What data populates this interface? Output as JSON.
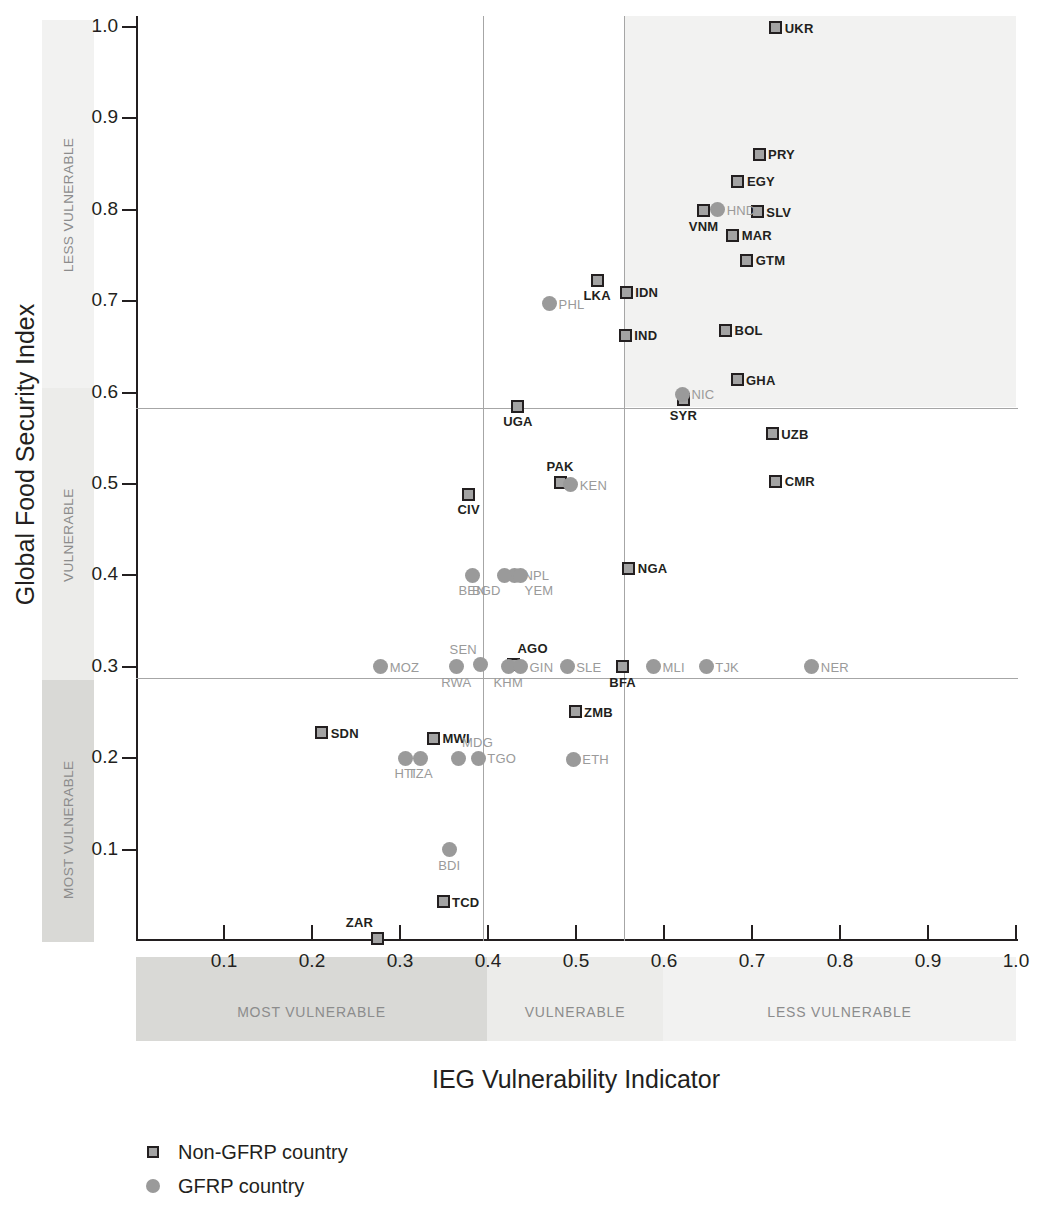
{
  "chart_data": {
    "type": "scatter",
    "title": "",
    "xlabel": "IEG Vulnerability Indicator",
    "ylabel": "Global Food Security Index",
    "xlim": [
      0,
      1.0
    ],
    "ylim": [
      0,
      1.0
    ],
    "grid": false,
    "x_ticks": [
      "0.1",
      "0.2",
      "0.3",
      "0.4",
      "0.5",
      "0.6",
      "0.7",
      "0.8",
      "0.9",
      "1.0"
    ],
    "x_tick_values": [
      0.1,
      0.2,
      0.3,
      0.4,
      0.5,
      0.6,
      0.7,
      0.8,
      0.9,
      1.0
    ],
    "y_ticks": [
      "0.1",
      "0.2",
      "0.3",
      "0.4",
      "0.5",
      "0.6",
      "0.7",
      "0.8",
      "0.9",
      "1.0"
    ],
    "y_tick_values": [
      0.1,
      0.2,
      0.3,
      0.4,
      0.5,
      0.6,
      0.7,
      0.8,
      0.9,
      1.0
    ],
    "x_band_labels": [
      "MOST VULNERABLE",
      "VULNERABLE",
      "LESS VULNERABLE"
    ],
    "y_band_labels": [
      "LESS VULNERABLE",
      "VULNERABLE",
      "MOST VULNERABLE"
    ],
    "x_dividers": [
      0.394,
      0.555
    ],
    "y_dividers": [
      0.583,
      0.288
    ],
    "legend_position": "bottom-left",
    "legend": [
      {
        "label": "Non-GFRP country",
        "marker": "square",
        "color": "#a3a3a3",
        "edge": "#231f20"
      },
      {
        "label": "GFRP country",
        "marker": "circle",
        "color": "#9a9a9a"
      }
    ],
    "series": [
      {
        "name": "Non-GFRP country",
        "marker": "square",
        "points": [
          {
            "label": "UKR",
            "x": 0.727,
            "y": 0.999,
            "lp": "lp-r"
          },
          {
            "label": "PRY",
            "x": 0.708,
            "y": 0.861,
            "lp": "lp-r"
          },
          {
            "label": "EGY",
            "x": 0.684,
            "y": 0.831,
            "lp": "lp-r"
          },
          {
            "label": "SLV",
            "x": 0.706,
            "y": 0.798,
            "lp": "lp-r"
          },
          {
            "label": "VNM",
            "x": 0.645,
            "y": 0.799,
            "lp": "lp-b"
          },
          {
            "label": "MAR",
            "x": 0.678,
            "y": 0.772,
            "lp": "lp-r"
          },
          {
            "label": "GTM",
            "x": 0.694,
            "y": 0.745,
            "lp": "lp-r"
          },
          {
            "label": "LKA",
            "x": 0.524,
            "y": 0.723,
            "lp": "lp-b"
          },
          {
            "label": "IDN",
            "x": 0.557,
            "y": 0.71,
            "lp": "lp-r"
          },
          {
            "label": "IND",
            "x": 0.556,
            "y": 0.663,
            "lp": "lp-r"
          },
          {
            "label": "BOL",
            "x": 0.67,
            "y": 0.668,
            "lp": "lp-r"
          },
          {
            "label": "GHA",
            "x": 0.683,
            "y": 0.614,
            "lp": "lp-r"
          },
          {
            "label": "SYR",
            "x": 0.622,
            "y": 0.592,
            "lp": "lp-b"
          },
          {
            "label": "UGA",
            "x": 0.434,
            "y": 0.585,
            "lp": "lp-b"
          },
          {
            "label": "UZB",
            "x": 0.723,
            "y": 0.555,
            "lp": "lp-r"
          },
          {
            "label": "CMR",
            "x": 0.727,
            "y": 0.503,
            "lp": "lp-r"
          },
          {
            "label": "PAK",
            "x": 0.482,
            "y": 0.502,
            "lp": "lp-t"
          },
          {
            "label": "CIV",
            "x": 0.378,
            "y": 0.489,
            "lp": "lp-b"
          },
          {
            "label": "NGA",
            "x": 0.56,
            "y": 0.408,
            "lp": "lp-r"
          },
          {
            "label": "AGO",
            "x": 0.429,
            "y": 0.303,
            "lp": "lp-tr"
          },
          {
            "label": "BFA",
            "x": 0.553,
            "y": 0.3,
            "lp": "lp-b"
          },
          {
            "label": "ZMB",
            "x": 0.499,
            "y": 0.251,
            "lp": "lp-r"
          },
          {
            "label": "SDN",
            "x": 0.211,
            "y": 0.228,
            "lp": "lp-r"
          },
          {
            "label": "MWI",
            "x": 0.338,
            "y": 0.222,
            "lp": "lp-r"
          },
          {
            "label": "TCD",
            "x": 0.349,
            "y": 0.043,
            "lp": "lp-r"
          },
          {
            "label": "ZAR",
            "x": 0.274,
            "y": 0.003,
            "lp": "lp-tl"
          }
        ]
      },
      {
        "name": "GFRP country",
        "marker": "circle",
        "points": [
          {
            "label": "HND",
            "x": 0.661,
            "y": 0.8,
            "lp": "lp-r"
          },
          {
            "label": "PHL",
            "x": 0.47,
            "y": 0.697,
            "lp": "lp-r"
          },
          {
            "label": "NIC",
            "x": 0.621,
            "y": 0.598,
            "lp": "lp-r"
          },
          {
            "label": "KEN",
            "x": 0.494,
            "y": 0.499,
            "lp": "lp-r"
          },
          {
            "label": "BEN",
            "x": 0.382,
            "y": 0.4,
            "lp": "lp-b"
          },
          {
            "label": "NPL",
            "x": 0.43,
            "y": 0.4,
            "lp": "lp-r"
          },
          {
            "label": "BGD",
            "x": 0.419,
            "y": 0.4,
            "lp": "lp-bl"
          },
          {
            "label": "YEM",
            "x": 0.437,
            "y": 0.4,
            "lp": "lp-br"
          },
          {
            "label": "MOZ",
            "x": 0.278,
            "y": 0.3,
            "lp": "lp-r"
          },
          {
            "label": "RWA",
            "x": 0.364,
            "y": 0.3,
            "lp": "lp-b"
          },
          {
            "label": "SEN",
            "x": 0.392,
            "y": 0.302,
            "lp": "lp-tl"
          },
          {
            "label": "KHM",
            "x": 0.423,
            "y": 0.3,
            "lp": "lp-b"
          },
          {
            "label": "GIN",
            "x": 0.437,
            "y": 0.3,
            "lp": "lp-r"
          },
          {
            "label": "SLE",
            "x": 0.49,
            "y": 0.3,
            "lp": "lp-r"
          },
          {
            "label": "MLI",
            "x": 0.588,
            "y": 0.3,
            "lp": "lp-r"
          },
          {
            "label": "TJK",
            "x": 0.648,
            "y": 0.3,
            "lp": "lp-r"
          },
          {
            "label": "NER",
            "x": 0.768,
            "y": 0.3,
            "lp": "lp-r"
          },
          {
            "label": "MDG",
            "x": 0.366,
            "y": 0.2,
            "lp": "lp-tr"
          },
          {
            "label": "TGO",
            "x": 0.389,
            "y": 0.2,
            "lp": "lp-r"
          },
          {
            "label": "HTI",
            "x": 0.306,
            "y": 0.2,
            "lp": "lp-b"
          },
          {
            "label": "TZA",
            "x": 0.323,
            "y": 0.2,
            "lp": "lp-b"
          },
          {
            "label": "ETH",
            "x": 0.497,
            "y": 0.199,
            "lp": "lp-r"
          },
          {
            "label": "BDI",
            "x": 0.356,
            "y": 0.1,
            "lp": "lp-b"
          }
        ]
      }
    ]
  }
}
